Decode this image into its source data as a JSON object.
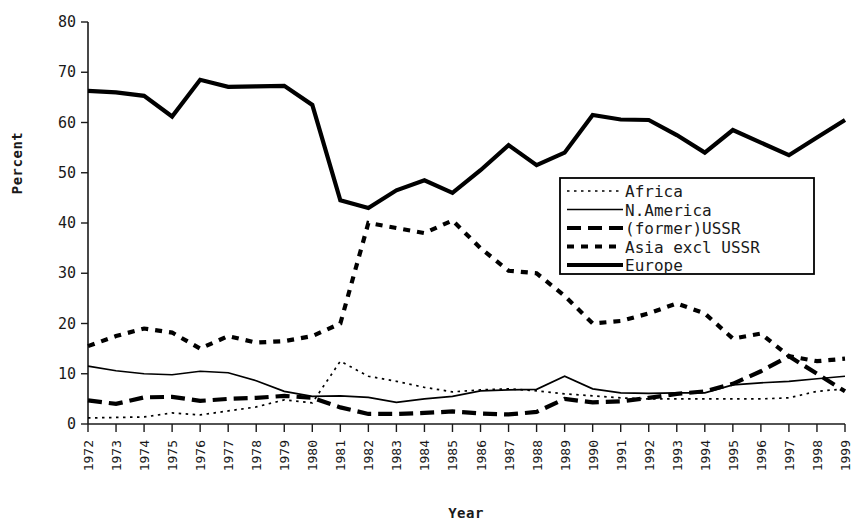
{
  "chart_data": {
    "type": "line",
    "title": "",
    "xlabel": "Year",
    "ylabel": "Percent",
    "ylim": [
      0,
      80
    ],
    "yticks": [
      0,
      10,
      20,
      30,
      40,
      50,
      60,
      70,
      80
    ],
    "grid": false,
    "legend_position": "center-right",
    "categories": [
      "1972",
      "1973",
      "1974",
      "1975",
      "1976",
      "1977",
      "1978",
      "1979",
      "1980",
      "1981",
      "1982",
      "1983",
      "1984",
      "1985",
      "1986",
      "1987",
      "1988",
      "1989",
      "1990",
      "1991",
      "1992",
      "1993",
      "1994",
      "1995",
      "1996",
      "1997",
      "1998",
      "1999"
    ],
    "series": [
      {
        "name": "Africa",
        "style": "fine-dotted",
        "values": [
          1.2,
          1.3,
          1.4,
          2.2,
          1.8,
          2.6,
          3.4,
          4.8,
          4.2,
          12.5,
          9.5,
          8.5,
          7.3,
          6.4,
          6.8,
          7.0,
          6.6,
          6.0,
          5.6,
          5.2,
          5.0,
          5.0,
          5.0,
          5.0,
          5.0,
          5.2,
          6.5,
          7.0
        ]
      },
      {
        "name": "N.America",
        "style": "thin-solid",
        "values": [
          11.5,
          10.6,
          10.0,
          9.8,
          10.5,
          10.2,
          8.6,
          6.5,
          5.5,
          5.6,
          5.3,
          4.3,
          5.0,
          5.5,
          6.6,
          6.8,
          6.9,
          9.5,
          7.0,
          6.2,
          6.1,
          6.2,
          6.2,
          7.8,
          8.2,
          8.5,
          9.0,
          9.5
        ]
      },
      {
        "name": "(former)USSR",
        "style": "thick-long-dash",
        "values": [
          4.7,
          4.0,
          5.3,
          5.4,
          4.6,
          5.0,
          5.2,
          5.6,
          5.2,
          3.3,
          2.0,
          2.0,
          2.2,
          2.5,
          2.1,
          1.9,
          2.4,
          5.0,
          4.3,
          4.5,
          5.2,
          6.0,
          6.5,
          8.0,
          10.5,
          13.5,
          10.0,
          6.5
        ]
      },
      {
        "name": "Asia excl USSR",
        "style": "thick-short-dash",
        "values": [
          15.5,
          17.5,
          19.0,
          18.2,
          15.0,
          17.5,
          16.2,
          16.5,
          17.5,
          20.0,
          40.0,
          39.0,
          38.0,
          40.5,
          35.0,
          30.5,
          30.0,
          25.5,
          20.0,
          20.5,
          22.0,
          24.0,
          22.0,
          17.0,
          18.0,
          13.5,
          12.5,
          13.0
        ]
      },
      {
        "name": "Europe",
        "style": "thick-solid",
        "values": [
          66.3,
          66.0,
          65.3,
          61.2,
          68.5,
          67.1,
          67.2,
          67.3,
          63.5,
          44.5,
          43.0,
          46.5,
          48.5,
          46.0,
          50.5,
          55.5,
          51.5,
          54.0,
          61.5,
          60.6,
          60.5,
          57.5,
          54.0,
          58.5,
          56.0,
          53.5,
          57.0,
          60.5
        ]
      }
    ]
  },
  "axes": {
    "y_title": "Percent",
    "x_title": "Year",
    "y_tick_labels": [
      "0",
      "10",
      "20",
      "30",
      "40",
      "50",
      "60",
      "70",
      "80"
    ],
    "x_tick_labels": [
      "1972",
      "1973",
      "1974",
      "1975",
      "1976",
      "1977",
      "1978",
      "1979",
      "1980",
      "1981",
      "1982",
      "1983",
      "1984",
      "1985",
      "1986",
      "1987",
      "1988",
      "1989",
      "1990",
      "1991",
      "1992",
      "1993",
      "1994",
      "1995",
      "1996",
      "1997",
      "1998",
      "1999"
    ]
  },
  "legend": {
    "items": [
      {
        "label": "Africa",
        "style": "fine-dotted"
      },
      {
        "label": "N.America",
        "style": "thin-solid"
      },
      {
        "label": "(former)USSR",
        "style": "thick-long-dash"
      },
      {
        "label": "Asia excl USSR",
        "style": "thick-short-dash"
      },
      {
        "label": "Europe",
        "style": "thick-solid"
      }
    ]
  },
  "colors": {
    "ink": "#000000",
    "background": "#ffffff"
  }
}
